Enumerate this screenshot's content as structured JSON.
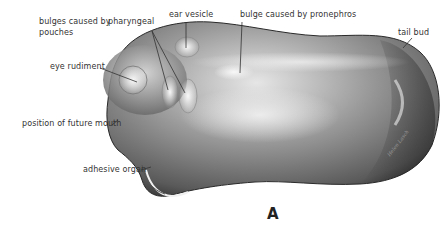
{
  "figure": {
    "panel_letter": "A",
    "signature": "Helen Lasch",
    "labels": {
      "bulges_line1": "bulges caused by",
      "bulges_line2": "pouches",
      "pharyngeal": "pharyngeal",
      "ear_vesicle": "ear vesicle",
      "bulge_pronephros": "bulge caused by pronephros",
      "tail_bud": "tail bud",
      "eye_rudiment": "eye rudiment",
      "future_mouth": "position of future mouth",
      "adhesive_organ": "adhesive organ"
    },
    "colors": {
      "body_dark": "#3a3a3a",
      "body_mid": "#8a8a8a",
      "body_light": "#f0f0f0",
      "leader_line": "#333333"
    }
  }
}
